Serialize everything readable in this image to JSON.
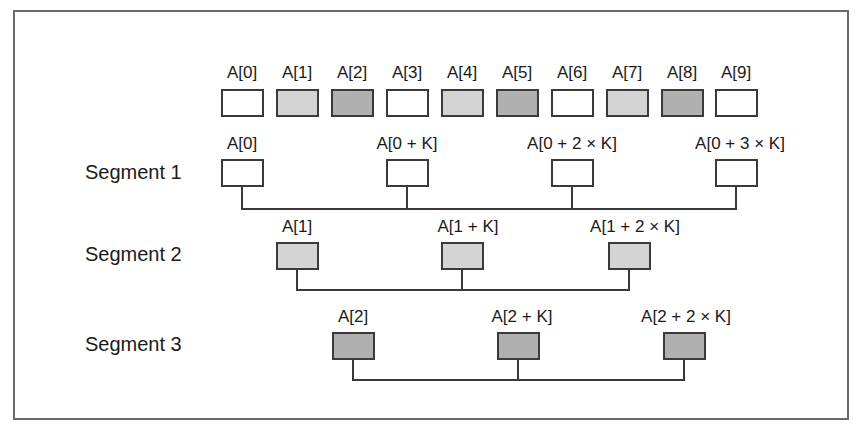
{
  "colors": {
    "white": "#ffffff",
    "light": "#d4d4d4",
    "dark": "#b0b0b0",
    "stroke": "#3a3a3a",
    "frame": "#6a6a6a"
  },
  "array_row": {
    "cells": [
      {
        "label": "A[0]",
        "shade": "white"
      },
      {
        "label": "A[1]",
        "shade": "light"
      },
      {
        "label": "A[2]",
        "shade": "dark"
      },
      {
        "label": "A[3]",
        "shade": "white"
      },
      {
        "label": "A[4]",
        "shade": "light"
      },
      {
        "label": "A[5]",
        "shade": "dark"
      },
      {
        "label": "A[6]",
        "shade": "white"
      },
      {
        "label": "A[7]",
        "shade": "light"
      },
      {
        "label": "A[8]",
        "shade": "dark"
      },
      {
        "label": "A[9]",
        "shade": "white"
      }
    ]
  },
  "segments": [
    {
      "title": "Segment 1",
      "shade": "white",
      "elements": [
        "A[0]",
        "A[0 + K]",
        "A[0 + 2 × K]",
        "A[0 + 3 ×  K]"
      ]
    },
    {
      "title": "Segment 2",
      "shade": "light",
      "elements": [
        "A[1]",
        "A[1 + K]",
        "A[1 + 2 × K]"
      ]
    },
    {
      "title": "Segment 3",
      "shade": "dark",
      "elements": [
        "A[2]",
        "A[2 + K]",
        "A[2 + 2 × K]"
      ]
    }
  ]
}
